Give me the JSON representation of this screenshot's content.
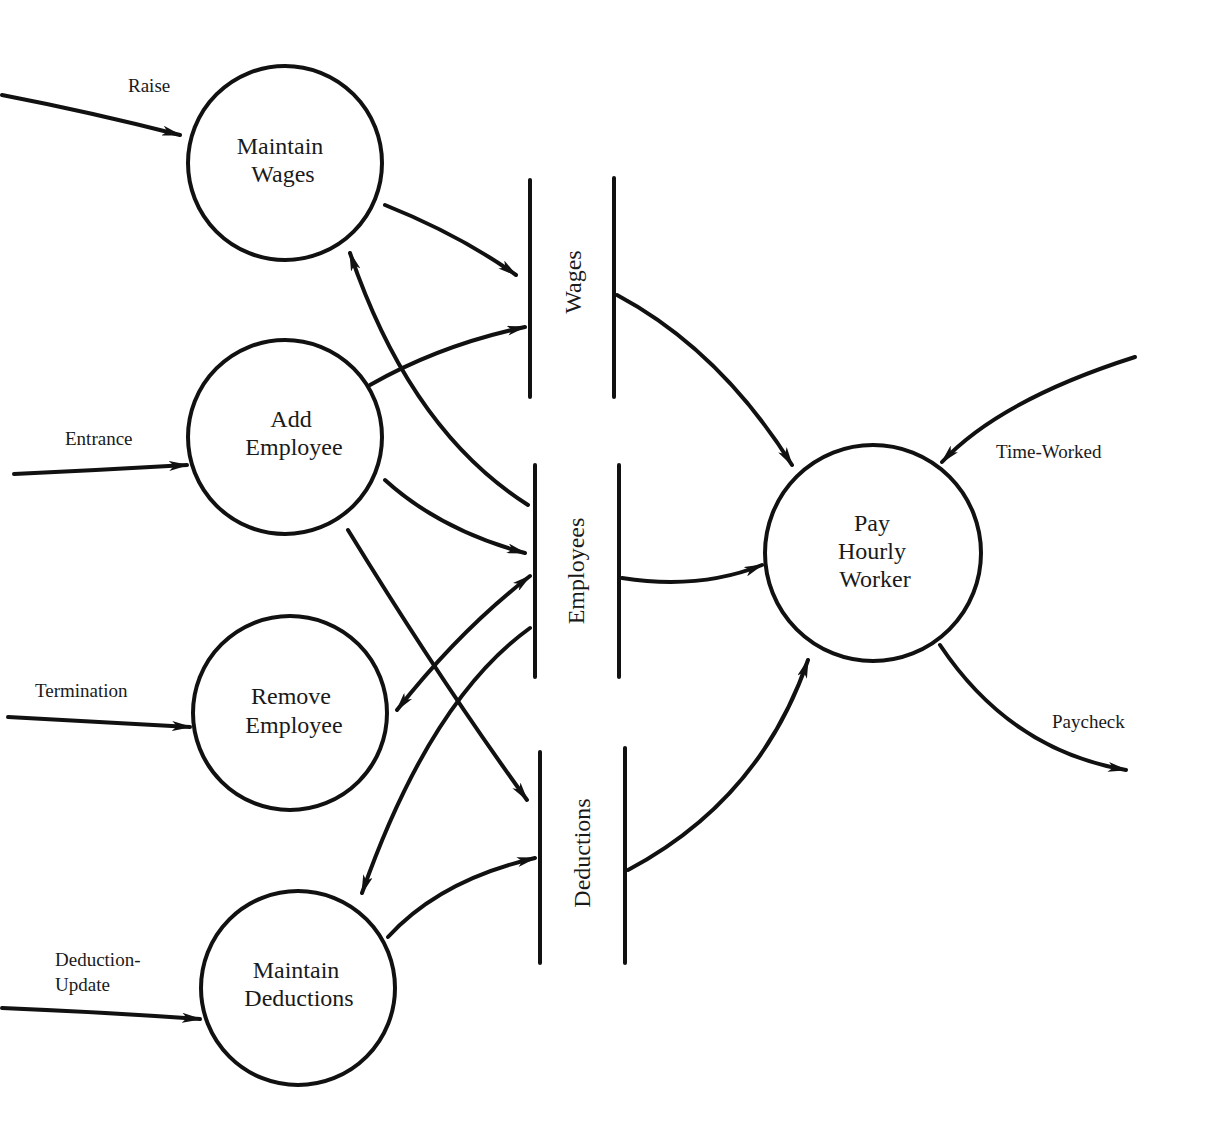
{
  "diagram": {
    "type": "data-flow-diagram",
    "processes": [
      {
        "id": "maintain_wages",
        "lines": [
          "Maintain",
          "Wages"
        ]
      },
      {
        "id": "add_employee",
        "lines": [
          "Add",
          "Employee"
        ]
      },
      {
        "id": "remove_employee",
        "lines": [
          "Remove",
          "Employee"
        ]
      },
      {
        "id": "maintain_deductions",
        "lines": [
          "Maintain",
          "Deductions"
        ]
      },
      {
        "id": "pay_hourly_worker",
        "lines": [
          "Pay",
          "Hourly",
          "Worker"
        ]
      }
    ],
    "data_stores": [
      {
        "id": "wages",
        "label": "Wages"
      },
      {
        "id": "employees",
        "label": "Employees"
      },
      {
        "id": "deductions",
        "label": "Deductions"
      }
    ],
    "external_flows": [
      {
        "label": "Raise",
        "to": "maintain_wages"
      },
      {
        "label": "Entrance",
        "to": "add_employee"
      },
      {
        "label": "Termination",
        "to": "remove_employee"
      },
      {
        "label_lines": [
          "Deduction-",
          "Update"
        ],
        "to": "maintain_deductions"
      },
      {
        "label": "Time-Worked",
        "to": "pay_hourly_worker"
      },
      {
        "label": "Paycheck",
        "from": "pay_hourly_worker"
      }
    ],
    "internal_flows": [
      {
        "from": "maintain_wages",
        "to": "wages"
      },
      {
        "from": "employees",
        "to": "maintain_wages"
      },
      {
        "from": "add_employee",
        "to": "wages"
      },
      {
        "from": "add_employee",
        "to": "employees"
      },
      {
        "from": "add_employee",
        "to": "deductions"
      },
      {
        "from": "remove_employee",
        "to": "employees",
        "bidirectional": true
      },
      {
        "from": "employees",
        "to": "maintain_deductions"
      },
      {
        "from": "maintain_deductions",
        "to": "deductions"
      },
      {
        "from": "wages",
        "to": "pay_hourly_worker"
      },
      {
        "from": "employees",
        "to": "pay_hourly_worker"
      },
      {
        "from": "deductions",
        "to": "pay_hourly_worker"
      }
    ]
  }
}
